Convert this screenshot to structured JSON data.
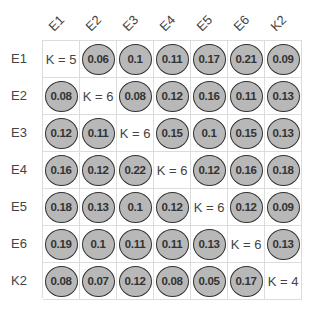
{
  "chart_data": {
    "type": "heatmap",
    "title": "",
    "rows": [
      "E1",
      "E2",
      "E3",
      "E4",
      "E5",
      "E6",
      "K2"
    ],
    "columns": [
      "E1",
      "E2",
      "E3",
      "E4",
      "E5",
      "E6",
      "K2"
    ],
    "diagonal_labels": [
      "K = 5",
      "K = 6",
      "K = 6",
      "K = 6",
      "K = 6",
      "K = 6",
      "K = 4"
    ],
    "values": [
      [
        null,
        0.06,
        0.1,
        0.11,
        0.17,
        0.21,
        0.09
      ],
      [
        0.08,
        null,
        0.08,
        0.12,
        0.16,
        0.11,
        0.13
      ],
      [
        0.12,
        0.11,
        null,
        0.15,
        0.1,
        0.15,
        0.13
      ],
      [
        0.16,
        0.12,
        0.22,
        null,
        0.12,
        0.16,
        0.18
      ],
      [
        0.18,
        0.13,
        0.1,
        0.12,
        null,
        0.12,
        0.09
      ],
      [
        0.19,
        0.1,
        0.11,
        0.11,
        0.13,
        null,
        0.13
      ],
      [
        0.08,
        0.07,
        0.12,
        0.08,
        0.05,
        0.17,
        null
      ]
    ],
    "display_values": [
      [
        "K = 5",
        "0.06",
        "0.1",
        "0.11",
        "0.17",
        "0.21",
        "0.09"
      ],
      [
        "0.08",
        "K = 6",
        "0.08",
        "0.12",
        "0.16",
        "0.11",
        "0.13"
      ],
      [
        "0.12",
        "0.11",
        "K = 6",
        "0.15",
        "0.1",
        "0.15",
        "0.13"
      ],
      [
        "0.16",
        "0.12",
        "0.22",
        "K = 6",
        "0.12",
        "0.16",
        "0.18"
      ],
      [
        "0.18",
        "0.13",
        "0.1",
        "0.12",
        "K = 6",
        "0.12",
        "0.09"
      ],
      [
        "0.19",
        "0.1",
        "0.11",
        "0.11",
        "0.13",
        "K = 6",
        "0.13"
      ],
      [
        "0.08",
        "0.07",
        "0.12",
        "0.08",
        "0.05",
        "0.17",
        "K = 4"
      ]
    ],
    "marker": "circle",
    "grid": true,
    "legend": null,
    "colors": {
      "bubble_fill": "#b8b8b8",
      "bubble_stroke": "#333333",
      "grid": "#dcdcdc",
      "text": "#333333"
    }
  }
}
